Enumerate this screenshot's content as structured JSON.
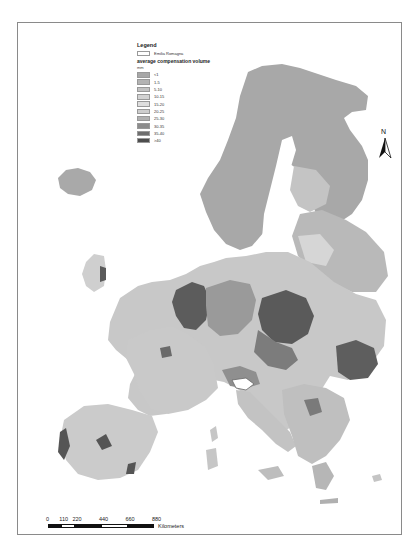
{
  "map": {
    "title": "Average compensation volume — Europe NUTS regions",
    "region_highlight": "Emilia Romagna"
  },
  "legend": {
    "title": "Legend",
    "highlight_label": "Emilia Romagna",
    "variable": "average compensation volume",
    "unit": "mm",
    "classes": [
      {
        "label": "<1",
        "color": "#a7a7a7"
      },
      {
        "label": "1-5",
        "color": "#b3b3b3"
      },
      {
        "label": "5-10",
        "color": "#c2c2c2"
      },
      {
        "label": "10-15",
        "color": "#d2d2d2"
      },
      {
        "label": "15-20",
        "color": "#dedede"
      },
      {
        "label": "20-25",
        "color": "#cdcdcd"
      },
      {
        "label": "25-30",
        "color": "#b0b0b0"
      },
      {
        "label": "30-35",
        "color": "#8c8c8c"
      },
      {
        "label": "35-40",
        "color": "#6e6e6e"
      },
      {
        "label": ">40",
        "color": "#4d4d4d"
      }
    ]
  },
  "north_arrow": {
    "label": "N"
  },
  "scale_bar": {
    "ticks": [
      "0",
      "110",
      "220",
      "440",
      "660",
      "880"
    ],
    "unit": "Kilometers"
  }
}
